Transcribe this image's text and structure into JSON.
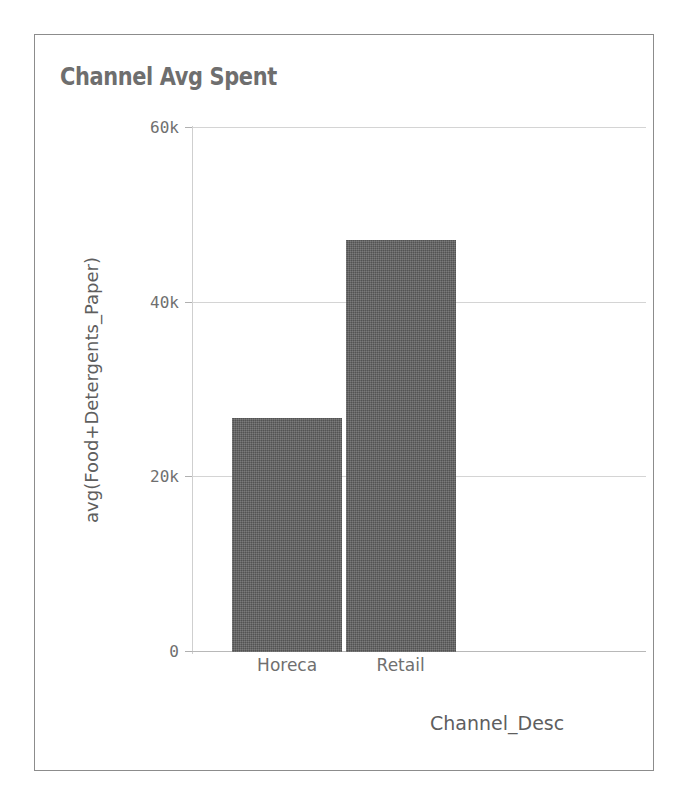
{
  "chart_data": {
    "type": "bar",
    "title": "Channel Avg Spent",
    "xlabel": "Channel_Desc",
    "ylabel": "avg(Food+Detergents_Paper)",
    "categories": [
      "Horeca",
      "Retail"
    ],
    "values": [
      26800,
      47200
    ],
    "ylim": [
      0,
      60000
    ],
    "yticks": [
      0,
      20000,
      40000,
      60000
    ],
    "ytick_labels": [
      "0",
      "20k",
      "40k",
      "60k"
    ],
    "grid": true,
    "legend": "none",
    "bar_color": "#5b5b5b",
    "text_color": "#6f6f6f",
    "title_color": "#6e6e6e",
    "border_color": "#8c8c8c",
    "background": "#ffffff"
  }
}
